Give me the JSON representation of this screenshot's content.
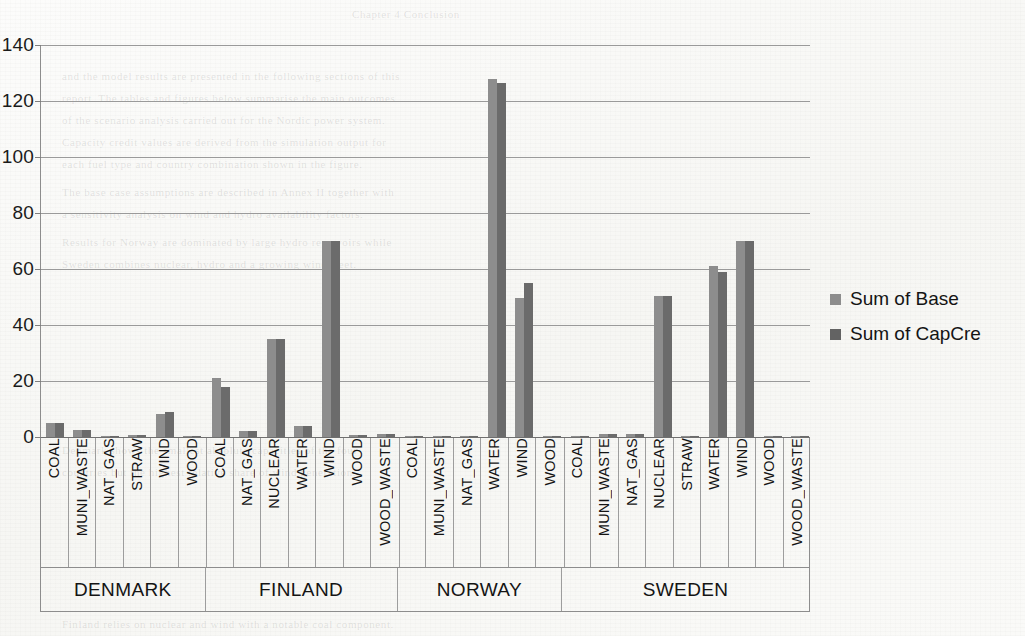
{
  "chart_data": {
    "type": "bar",
    "title": "",
    "xlabel": "",
    "ylabel": "",
    "ylim": [
      0,
      140
    ],
    "yticks": [
      0,
      20,
      40,
      60,
      80,
      100,
      120,
      140
    ],
    "grid": true,
    "legend_position": "right",
    "series": [
      {
        "name": "Sum of Base",
        "color": "#8d8d8d"
      },
      {
        "name": "Sum of CapCre",
        "color": "#6b6b6b"
      }
    ],
    "groups": [
      {
        "country": "DENMARK",
        "categories": [
          "COAL",
          "MUNI_WASTE",
          "NAT_GAS",
          "STRAW",
          "WIND",
          "WOOD"
        ],
        "values": {
          "Sum of Base": [
            5.0,
            2.5,
            0.3,
            0.6,
            8.3,
            0.3
          ],
          "Sum of CapCre": [
            5.0,
            2.5,
            0.3,
            0.6,
            9.0,
            0.3
          ]
        }
      },
      {
        "country": "FINLAND",
        "categories": [
          "COAL",
          "NAT_GAS",
          "NUCLEAR",
          "WATER",
          "WIND",
          "WOOD",
          "WOOD_WASTE"
        ],
        "values": {
          "Sum of Base": [
            21.0,
            2.0,
            35.0,
            4.0,
            70.0,
            0.7,
            1.0
          ],
          "Sum of CapCre": [
            18.0,
            2.0,
            35.0,
            4.0,
            70.0,
            0.7,
            1.0
          ]
        }
      },
      {
        "country": "NORWAY",
        "categories": [
          "COAL",
          "MUNI_WASTE",
          "NAT_GAS",
          "WATER",
          "WIND",
          "WOOD"
        ],
        "values": {
          "Sum of Base": [
            0.2,
            0.2,
            0.2,
            128.0,
            49.5,
            0.2
          ],
          "Sum of CapCre": [
            0.2,
            0.2,
            0.2,
            126.5,
            55.0,
            0.2
          ]
        }
      },
      {
        "country": "SWEDEN",
        "categories": [
          "COAL",
          "MUNI_WASTE",
          "NAT_GAS",
          "NUCLEAR",
          "STRAW",
          "WATER",
          "WIND",
          "WOOD",
          "WOOD_WASTE"
        ],
        "values": {
          "Sum of Base": [
            0.3,
            1.0,
            0.9,
            50.5,
            0.3,
            61.0,
            70.0,
            0.3,
            0.3
          ],
          "Sum of CapCre": [
            0.3,
            1.0,
            0.9,
            50.5,
            0.3,
            59.0,
            70.0,
            0.3,
            0.3
          ]
        }
      }
    ]
  },
  "legend": {
    "items": [
      {
        "label": "Sum of Base",
        "color": "#8d8d8d"
      },
      {
        "label": "Sum of CapCre",
        "color": "#636363"
      }
    ]
  },
  "background_text": {
    "lines": [
      "Chapter 4 Conclusion",
      "and the model results are presented in the following sections of this",
      "report. The tables and figures below summarise the main outcomes",
      "of the scenario analysis carried out for the Nordic power system.",
      "Capacity credit values are derived from the simulation output for",
      "each fuel type and country combination shown in the figure.",
      "The base case assumptions are described in Annex II together with",
      "a sensitivity analysis on wind and hydro availability factors.",
      "Results for Norway are dominated by large hydro reservoirs while",
      "Sweden combines nuclear, hydro and a growing wind fleet.",
      "Denmark shows the smallest absolute capacities of the four",
      "countries but the highest relative share of wind generation.",
      "Finland relies on nuclear and wind with a notable coal component.",
      "Figure 4.7 Base and capacity credit by fuel type and country."
    ]
  }
}
